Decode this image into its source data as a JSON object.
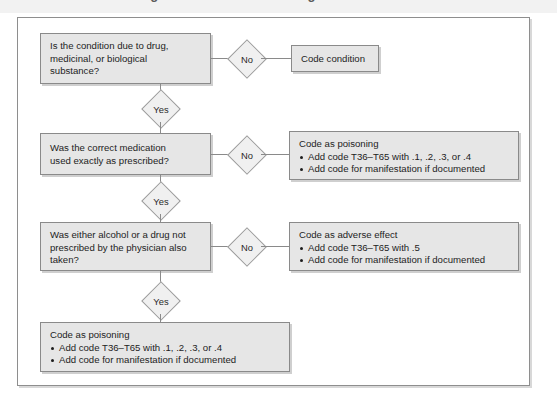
{
  "page": {
    "title_partial": "Coding Guidelines for Poisoning and Adverse Effects",
    "frame_border_color": "#8e8e8e",
    "node_fill": "#e6e6e6",
    "diamond_fill": "#f0f0f0",
    "line_color": "#8a8a8a"
  },
  "flowchart": {
    "type": "decision-flowchart",
    "nodes": [
      {
        "id": "q1",
        "kind": "question",
        "text": "Is the condition due to drug,\nmedicinal, or biological\nsubstance?"
      },
      {
        "id": "d1-no",
        "kind": "decision-label",
        "text": "No"
      },
      {
        "id": "out1",
        "kind": "outcome",
        "head": "Code condition",
        "bullets": []
      },
      {
        "id": "d1-yes",
        "kind": "decision-label",
        "text": "Yes"
      },
      {
        "id": "q2",
        "kind": "question",
        "text": "Was the correct medication\nused exactly as prescribed?"
      },
      {
        "id": "d2-no",
        "kind": "decision-label",
        "text": "No"
      },
      {
        "id": "out2",
        "kind": "outcome",
        "head": "Code as poisoning",
        "bullets": [
          "Add code T36–T65 with .1, .2, .3, or .4",
          "Add code for manifestation if documented"
        ]
      },
      {
        "id": "d2-yes",
        "kind": "decision-label",
        "text": "Yes"
      },
      {
        "id": "q3",
        "kind": "question",
        "text": "Was either alcohol or a drug not\nprescribed by the physician also\ntaken?"
      },
      {
        "id": "d3-no",
        "kind": "decision-label",
        "text": "No"
      },
      {
        "id": "out3",
        "kind": "outcome",
        "head": "Code as adverse effect",
        "bullets": [
          "Add code T36–T65 with .5",
          "Add code for manifestation if documented"
        ]
      },
      {
        "id": "d3-yes",
        "kind": "decision-label",
        "text": "Yes"
      },
      {
        "id": "out4",
        "kind": "outcome",
        "head": "Code as poisoning",
        "bullets": [
          "Add code T36–T65 with .1, .2, .3, or .4",
          "Add code for manifestation if documented"
        ]
      }
    ]
  }
}
